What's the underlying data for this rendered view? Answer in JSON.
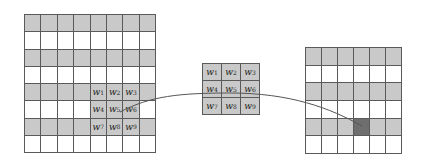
{
  "diagram": {
    "type": "convolution-illustration",
    "colors": {
      "gray_fill": "#c9c9c9",
      "dark_fill": "#6e6e6e",
      "white_fill": "#ffffff",
      "grid_line": "#5a5a5a",
      "curve": "#555555"
    },
    "input_grid": {
      "rows": 8,
      "cols": 8,
      "gray_rows": [
        0,
        2,
        4,
        6
      ],
      "kernel_overlay": {
        "row_start": 4,
        "col_start": 4,
        "size": 3
      }
    },
    "kernel": {
      "rows": 3,
      "cols": 3,
      "labels": [
        "w1",
        "w2",
        "w3",
        "w4",
        "w5",
        "w6",
        "w7",
        "w8",
        "w9"
      ]
    },
    "output_grid": {
      "rows": 6,
      "cols": 6,
      "gray_rows": [
        0,
        2,
        4
      ],
      "highlight": {
        "row": 4,
        "col": 3
      }
    },
    "connector": {
      "from": "input w5",
      "via": "kernel",
      "to": "output highlighted cell"
    }
  }
}
